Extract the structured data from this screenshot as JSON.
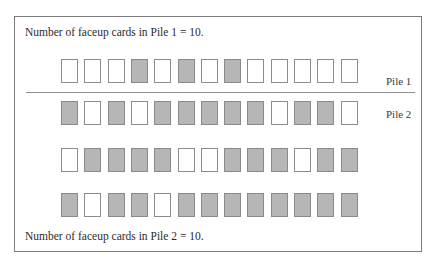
{
  "captions": {
    "pile1_count": "Number of faceup cards in Pile 1 = 10.",
    "pile2_count": "Number of faceup cards in Pile 2 = 10."
  },
  "labels": {
    "pile1": "Pile 1",
    "pile2": "Pile 2"
  },
  "colors": {
    "faceup_fill": "#ffffff",
    "facedown_fill": "#b6b6b6",
    "card_border": "#8c8c8c",
    "frame": "#7c7c7c"
  },
  "legend_note": "white = faceup, gray = facedown",
  "rows": [
    {
      "pile": "Pile 1",
      "cards": [
        "up",
        "up",
        "up",
        "down",
        "up",
        "down",
        "up",
        "down",
        "up",
        "up",
        "up",
        "up",
        "up"
      ]
    },
    {
      "pile": "Pile 2",
      "cards": [
        "down",
        "up",
        "down",
        "up",
        "down",
        "down",
        "down",
        "down",
        "down",
        "up",
        "down",
        "down",
        "up"
      ]
    },
    {
      "pile": "",
      "cards": [
        "up",
        "down",
        "down",
        "down",
        "down",
        "up",
        "up",
        "down",
        "down",
        "down",
        "up",
        "down",
        "down"
      ]
    },
    {
      "pile": "",
      "cards": [
        "down",
        "up",
        "down",
        "down",
        "up",
        "down",
        "down",
        "down",
        "down",
        "down",
        "down",
        "down",
        "down"
      ]
    }
  ]
}
